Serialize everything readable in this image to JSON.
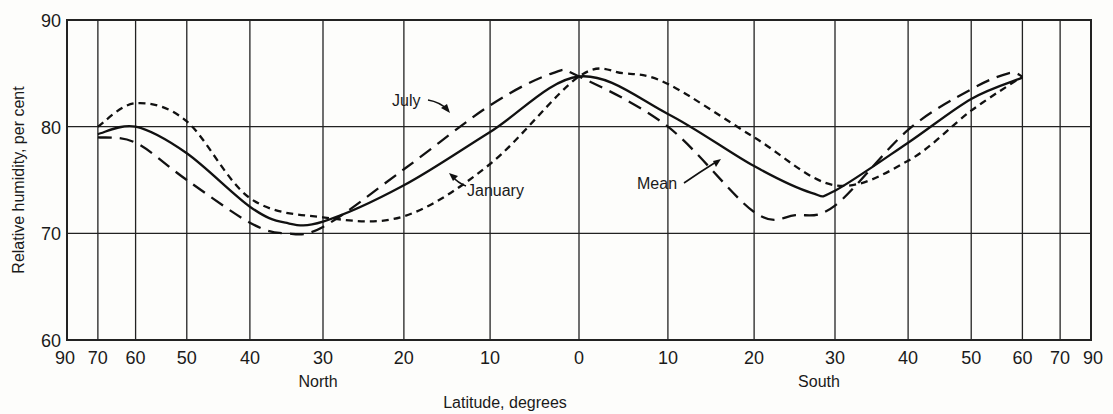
{
  "chart_data": {
    "type": "line",
    "title": "",
    "xlabel": "Latitude, degrees",
    "ylabel": "Relative humidity, per cent",
    "ylim": [
      60,
      90
    ],
    "xlim": [
      -90,
      90
    ],
    "x_scale": "sine of latitude (equal-area)",
    "grid": true,
    "hemisphere_labels": {
      "north": "North",
      "south": "South"
    },
    "y_ticks": [
      60,
      70,
      80,
      90
    ],
    "x_ticks": [
      {
        "lat": -90,
        "label": "90"
      },
      {
        "lat": -70,
        "label": "70"
      },
      {
        "lat": -60,
        "label": "60"
      },
      {
        "lat": -50,
        "label": "50"
      },
      {
        "lat": -40,
        "label": "40"
      },
      {
        "lat": -30,
        "label": "30"
      },
      {
        "lat": -20,
        "label": "20"
      },
      {
        "lat": -10,
        "label": "10"
      },
      {
        "lat": 0,
        "label": "0"
      },
      {
        "lat": 10,
        "label": "10"
      },
      {
        "lat": 20,
        "label": "20"
      },
      {
        "lat": 30,
        "label": "30"
      },
      {
        "lat": 40,
        "label": "40"
      },
      {
        "lat": 50,
        "label": "50"
      },
      {
        "lat": 60,
        "label": "60"
      },
      {
        "lat": 70,
        "label": "70"
      },
      {
        "lat": 90,
        "label": "90"
      }
    ],
    "x_note": "negative latitude = North, positive = South",
    "series": [
      {
        "name": "Mean",
        "style": "solid",
        "x": [
          -70,
          -60,
          -50,
          -40,
          -35,
          -30,
          -20,
          -10,
          0,
          10,
          20,
          27,
          30,
          40,
          50,
          60
        ],
        "values": [
          79.3,
          80.0,
          77.5,
          72.5,
          71.0,
          71.1,
          74.5,
          79.5,
          84.7,
          81.2,
          76.3,
          73.8,
          74.0,
          78.5,
          82.6,
          84.6
        ]
      },
      {
        "name": "July",
        "style": "long-dash",
        "x": [
          -70,
          -60,
          -50,
          -40,
          -35,
          -30,
          -20,
          -10,
          -3,
          0,
          10,
          20,
          25,
          30,
          40,
          50,
          57,
          60
        ],
        "values": [
          79.0,
          78.5,
          75.0,
          71.0,
          70.0,
          70.6,
          76.0,
          82.0,
          85.0,
          84.7,
          80.0,
          72.0,
          71.7,
          72.6,
          79.7,
          83.5,
          85.0,
          84.7
        ]
      },
      {
        "name": "January",
        "style": "short-dash",
        "x": [
          -70,
          -60,
          -50,
          -40,
          -30,
          -20,
          -10,
          0,
          5,
          10,
          20,
          30,
          40,
          50,
          60
        ],
        "values": [
          80.0,
          82.2,
          80.5,
          73.3,
          71.5,
          71.6,
          76.5,
          84.7,
          85.0,
          84.0,
          79.0,
          74.5,
          76.8,
          81.5,
          84.7
        ]
      }
    ],
    "annotations": [
      {
        "text": "July",
        "series": "July",
        "arrow": true
      },
      {
        "text": "January",
        "series": "January",
        "arrow": true
      },
      {
        "text": "Mean",
        "series": "Mean",
        "arrow": true
      }
    ]
  }
}
